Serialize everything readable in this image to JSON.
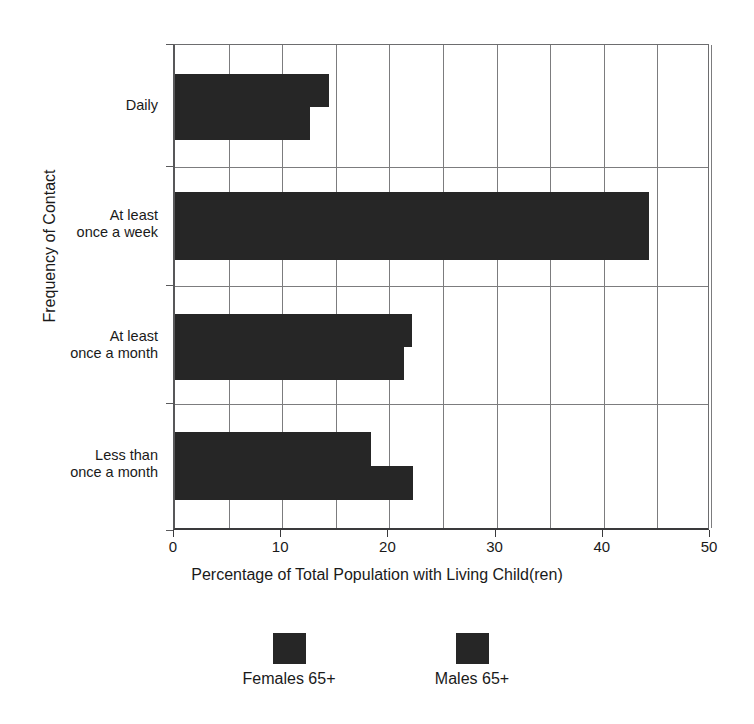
{
  "chart_data": {
    "type": "bar",
    "orientation": "horizontal",
    "title": "",
    "xlabel": "Percentage of Total Population with Living Child(ren)",
    "ylabel": "Frequency of Contact",
    "categories": [
      "Daily",
      "At least\nonce a week",
      "At least\nonce a month",
      "Less than\nonce a month"
    ],
    "series": [
      {
        "name": "Females 65+",
        "values": [
          14.4,
          44.2,
          22.1,
          18.3
        ],
        "color": "#262626"
      },
      {
        "name": "Males 65+",
        "values": [
          12.6,
          44.2,
          21.4,
          22.2
        ],
        "color": "#262626"
      }
    ],
    "xlim": [
      0,
      50
    ],
    "xticks": [
      0,
      10,
      20,
      30,
      40,
      50
    ],
    "xticklabels": [
      "0",
      "10",
      "20",
      "30",
      "40",
      "50"
    ],
    "minor_gridlines_step": 5,
    "grid": true,
    "legend_position": "bottom"
  },
  "legend": {
    "entries": [
      {
        "label": "Females 65+",
        "color": "#262626"
      },
      {
        "label": "Males 65+",
        "color": "#262626"
      }
    ]
  },
  "axes": {
    "x_title": "Percentage of Total Population with Living Child(ren)",
    "y_title": "Frequency of Contact"
  }
}
